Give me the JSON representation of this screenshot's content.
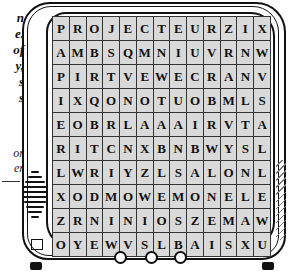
{
  "side_text": {
    "fragments_upper": [
      "n",
      "e.",
      "of",
      "y,",
      "s",
      "s"
    ],
    "fragments_lower": [
      "or",
      "er"
    ]
  },
  "word_search": {
    "rows": 10,
    "columns": 13,
    "grid": [
      [
        "P",
        "R",
        "O",
        "J",
        "E",
        "C",
        "T",
        "E",
        "U",
        "R",
        "Z",
        "I",
        "X"
      ],
      [
        "A",
        "M",
        "B",
        "S",
        "Q",
        "M",
        "N",
        "I",
        "U",
        "V",
        "R",
        "N",
        "W"
      ],
      [
        "P",
        "I",
        "R",
        "T",
        "V",
        "E",
        "W",
        "E",
        "C",
        "R",
        "A",
        "N",
        "V"
      ],
      [
        "I",
        "X",
        "Q",
        "O",
        "N",
        "O",
        "T",
        "U",
        "O",
        "B",
        "M",
        "L",
        "S"
      ],
      [
        "E",
        "O",
        "B",
        "R",
        "L",
        "A",
        "A",
        "A",
        "I",
        "R",
        "V",
        "T",
        "A"
      ],
      [
        "R",
        "I",
        "T",
        "C",
        "N",
        "X",
        "B",
        "N",
        "B",
        "W",
        "Y",
        "S",
        "L"
      ],
      [
        "L",
        "W",
        "R",
        "I",
        "Y",
        "Z",
        "L",
        "S",
        "A",
        "L",
        "O",
        "N",
        "L"
      ],
      [
        "X",
        "O",
        "D",
        "M",
        "O",
        "W",
        "E",
        "M",
        "O",
        "N",
        "E",
        "L",
        "E"
      ],
      [
        "Z",
        "R",
        "N",
        "I",
        "N",
        "I",
        "O",
        "S",
        "Z",
        "E",
        "M",
        "A",
        "W"
      ],
      [
        "O",
        "Y",
        "E",
        "W",
        "V",
        "S",
        "L",
        "B",
        "A",
        "I",
        "S",
        "X",
        "U"
      ]
    ]
  },
  "colors": {
    "cell_fill": "#d9d9d9",
    "ink": "#111111"
  },
  "tv_controls": {
    "knobs": 3
  }
}
